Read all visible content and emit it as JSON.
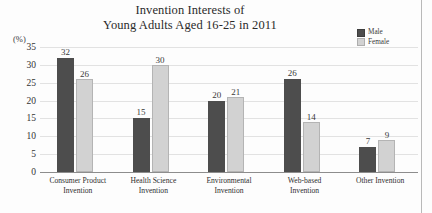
{
  "chart_data": {
    "type": "bar",
    "title": "Invention Interests of Young Adults Aged 16-25 in 2011",
    "title_lines": [
      "Invention Interests of",
      "Young Adults Aged 16-25 in 2011"
    ],
    "xlabel": "",
    "ylabel": "(%)",
    "ylim": [
      0,
      35
    ],
    "yticks": [
      35,
      30,
      25,
      20,
      15,
      10,
      5,
      0
    ],
    "grid": true,
    "legend_position": "top-right",
    "categories": [
      "Consumer Product Invention",
      "Health Science Invention",
      "Environmental Invention",
      "Web-based Invention",
      "Other Invention"
    ],
    "category_lines": [
      [
        "Consumer Product",
        "Invention"
      ],
      [
        "Health Science",
        "Invention"
      ],
      [
        "Environmental",
        "Invention"
      ],
      [
        "Web-based",
        "Invention"
      ],
      [
        "Other Invention"
      ]
    ],
    "series": [
      {
        "name": "Male",
        "color": "#4d4d4d",
        "values": [
          32,
          15,
          20,
          26,
          7
        ]
      },
      {
        "name": "Female",
        "color": "#d2d2d2",
        "values": [
          26,
          30,
          21,
          14,
          9
        ]
      }
    ]
  },
  "legend": {
    "items": [
      {
        "label": "Male"
      },
      {
        "label": "Female"
      }
    ]
  }
}
